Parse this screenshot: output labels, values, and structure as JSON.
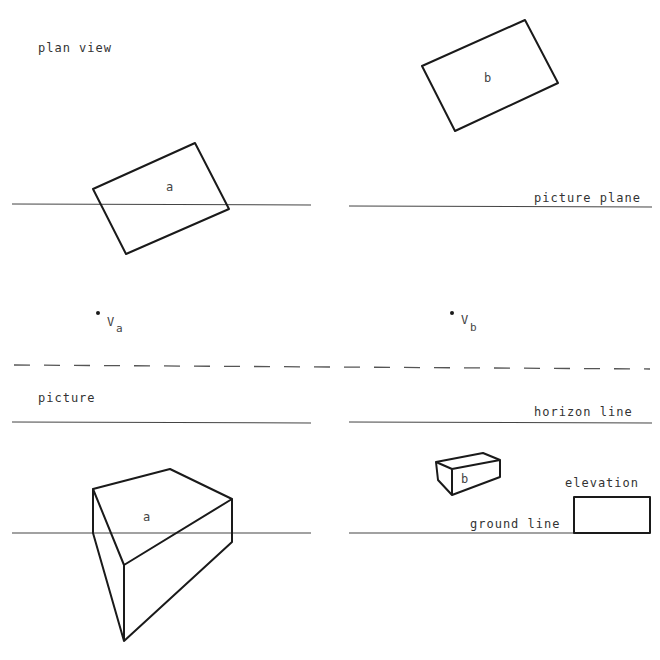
{
  "labels": {
    "plan_view": "plan view",
    "picture_plane": "picture plane",
    "picture": "picture",
    "horizon_line": "horizon line",
    "ground_line": "ground line",
    "elevation": "elevation",
    "plan_a": "a",
    "plan_b": "b",
    "persp_a": "a",
    "persp_b": "b",
    "va_main": "V",
    "va_sub": "a",
    "vb_main": "V",
    "vb_sub": "b"
  },
  "colors": {
    "background": "#ffffff",
    "ink": "#1a1a1a"
  },
  "geometry": {
    "plan_a": "93,189 195,143 229,209 126,254",
    "plan_b": "422,66 525,20 558,83 455,131",
    "elevation_rect": "574,497 650,497 650,533 574,533",
    "block_a_top": "93,489 170,469 232,499 124,565",
    "block_a_edges": "M93,489 L93,533 L124,641 L124,565 M124,641 L232,542 L232,499",
    "box_b_outline": "M436,462 L483,453 L500,460 L500,477 L452,495 L438,480 Z",
    "box_b_inner": "M436,462 L452,469 L500,460 M452,469 L452,495"
  }
}
